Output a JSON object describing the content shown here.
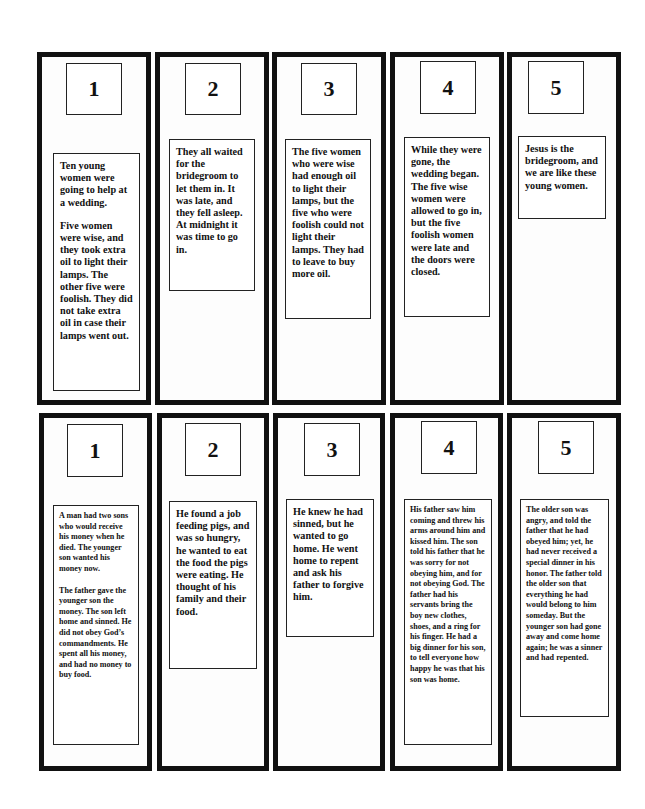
{
  "top_row": {
    "panels": [
      {
        "number": "1",
        "paragraphs": [
          "Ten young women were going to help at a wedding.",
          "Five women were wise, and they took extra oil to light their lamps. The other five were foolish. They did not take extra oil in case their lamps went out."
        ]
      },
      {
        "number": "2",
        "paragraphs": [
          "They all waited for the bridegroom to let them in.  It was late, and they fell asleep.  At midnight it was time to go in."
        ]
      },
      {
        "number": "3",
        "paragraphs": [
          "The five women who were wise had enough oil to light their lamps, but the five who were foolish could not light their lamps.  They had to leave to buy more oil."
        ]
      },
      {
        "number": "4",
        "paragraphs": [
          "While they were gone, the wedding began.  The five wise women were allowed to go in, but the five foolish women were late and the doors were closed."
        ]
      },
      {
        "number": "5",
        "paragraphs": [
          "Jesus is the bridegroom, and we are like these young women."
        ]
      }
    ]
  },
  "bottom_row": {
    "panels": [
      {
        "number": "1",
        "paragraphs": [
          "A man had two sons who would receive his money when he died. The younger son wanted his money now.",
          "The father gave the younger son the money.  The son left home and sinned.  He did not obey God’s commandments. He spent all his money, and had no money to buy food."
        ]
      },
      {
        "number": "2",
        "paragraphs": [
          "He found a job feeding pigs, and was so hungry, he wanted to eat the food the pigs were eating.  He thought of his family and their food."
        ]
      },
      {
        "number": "3",
        "paragraphs": [
          "He knew he had sinned, but he wanted to go home.  He went home to repent and ask his father to forgive him."
        ]
      },
      {
        "number": "4",
        "paragraphs": [
          "His father saw him coming and threw his arms around him and kissed him.  The son told his father that he was sorry for not obeying him, and for not obeying God.  The father had his servants bring the boy new clothes, shoes, and a ring for his finger.  He had a big dinner for his son, to tell everyone how happy he was that his son was home."
        ]
      },
      {
        "number": "5",
        "paragraphs": [
          "The older son was angry, and told the father that he had obeyed him; yet, he had never received a special dinner in his honor.  The father told the older son that everything he had would belong to him someday. But the younger son had gone away and come home again; he was a sinner and had repented."
        ]
      }
    ]
  }
}
